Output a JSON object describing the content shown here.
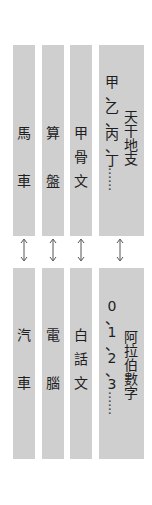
{
  "diagram": {
    "colors": {
      "box": "#cfcfcf",
      "text": "#1e1e1e",
      "arrow": "#555555"
    },
    "top_row": [
      {
        "id": "horse-cart",
        "chars": [
          "馬",
          "",
          "",
          "",
          "車"
        ]
      },
      {
        "id": "abacus",
        "chars": [
          "算",
          "",
          "",
          "",
          "盤"
        ]
      },
      {
        "id": "oracle-bone-script",
        "chars": [
          "甲",
          "",
          "骨",
          "",
          "文"
        ]
      },
      {
        "id": "heavenly-stems",
        "left_chars": [
          "甲",
          "、",
          "乙",
          "、",
          "丙",
          "、",
          "丁",
          "…",
          "…"
        ],
        "right_chars": [
          "天",
          "干",
          "地",
          "支"
        ]
      }
    ],
    "bottom_row": [
      {
        "id": "automobile",
        "chars": [
          "汽",
          "",
          "",
          "",
          "車"
        ]
      },
      {
        "id": "computer",
        "chars": [
          "電",
          "",
          "",
          "",
          "腦"
        ]
      },
      {
        "id": "vernacular-chinese",
        "chars": [
          "白",
          "",
          "話",
          "",
          "文"
        ]
      },
      {
        "id": "arabic-numerals",
        "left_chars": [
          "0",
          "、",
          "1",
          "、",
          "2",
          "、",
          "3",
          "…",
          "…"
        ],
        "right_chars": [
          "阿",
          "拉",
          "伯",
          "數",
          "字"
        ]
      }
    ],
    "connector": "↕"
  }
}
